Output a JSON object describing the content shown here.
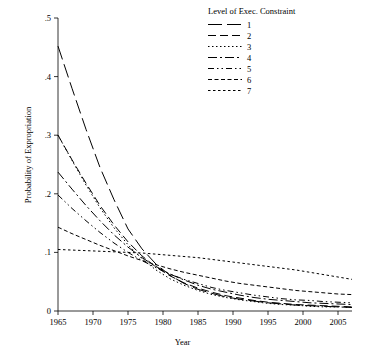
{
  "chart_data": {
    "type": "line",
    "title": "",
    "xlabel": "Year",
    "ylabel": "Probability of Expropriation",
    "xlim": [
      1965,
      2007
    ],
    "ylim": [
      0,
      0.5
    ],
    "xticks": [
      1965,
      1970,
      1975,
      1980,
      1985,
      1990,
      1995,
      2000,
      2005
    ],
    "xticklabels": [
      "1965",
      "1970",
      "1975",
      "1980",
      "1985",
      "1990",
      "1995",
      "2000",
      "2005"
    ],
    "yticks": [
      0,
      0.1,
      0.2,
      0.3,
      0.4,
      0.5
    ],
    "yticklabels": [
      "0",
      ".1",
      ".2",
      ".3",
      ".4",
      ".5"
    ],
    "grid": false,
    "legend": {
      "title": "Level of Exec. Constraint",
      "position": "top-right",
      "entries": [
        {
          "label": "1",
          "dash": "14 5"
        },
        {
          "label": "2",
          "dash": "8 4"
        },
        {
          "label": "3",
          "dash": "1.5 2.5"
        },
        {
          "label": "4",
          "dash": "9 3 2 3"
        },
        {
          "label": "5",
          "dash": "6 3 1.5 3 1.5 3"
        },
        {
          "label": "6",
          "dash": "4 2.5"
        },
        {
          "label": "7",
          "dash": "2.5 2.5"
        }
      ]
    },
    "x": [
      1965,
      1967,
      1969,
      1971,
      1973,
      1975,
      1977,
      1979,
      1981,
      1983,
      1985,
      1987,
      1989,
      1991,
      1993,
      1995,
      1997,
      1999,
      2001,
      2003,
      2005,
      2007
    ],
    "series": [
      {
        "name": "1",
        "values": [
          0.452,
          0.38,
          0.31,
          0.245,
          0.19,
          0.14,
          0.106,
          0.08,
          0.061,
          0.047,
          0.037,
          0.03,
          0.024,
          0.02,
          0.017,
          0.014,
          0.012,
          0.01,
          0.009,
          0.008,
          0.007,
          0.006
        ]
      },
      {
        "name": "2",
        "values": [
          0.3,
          0.258,
          0.218,
          0.18,
          0.147,
          0.118,
          0.094,
          0.075,
          0.06,
          0.048,
          0.039,
          0.032,
          0.026,
          0.022,
          0.018,
          0.015,
          0.013,
          0.011,
          0.01,
          0.009,
          0.008,
          0.007
        ]
      },
      {
        "name": "3",
        "values": [
          0.3,
          0.257,
          0.215,
          0.176,
          0.142,
          0.113,
          0.089,
          0.07,
          0.055,
          0.044,
          0.035,
          0.028,
          0.023,
          0.019,
          0.016,
          0.013,
          0.011,
          0.01,
          0.008,
          0.007,
          0.007,
          0.006
        ]
      },
      {
        "name": "4",
        "values": [
          0.237,
          0.208,
          0.18,
          0.154,
          0.13,
          0.109,
          0.091,
          0.076,
          0.063,
          0.053,
          0.044,
          0.037,
          0.032,
          0.027,
          0.023,
          0.02,
          0.018,
          0.016,
          0.014,
          0.013,
          0.012,
          0.011
        ]
      },
      {
        "name": "5",
        "values": [
          0.198,
          0.175,
          0.154,
          0.134,
          0.116,
          0.1,
          0.086,
          0.074,
          0.063,
          0.054,
          0.047,
          0.04,
          0.035,
          0.031,
          0.027,
          0.024,
          0.021,
          0.019,
          0.018,
          0.016,
          0.015,
          0.014
        ]
      },
      {
        "name": "6",
        "values": [
          0.143,
          0.132,
          0.122,
          0.112,
          0.103,
          0.094,
          0.086,
          0.079,
          0.072,
          0.066,
          0.061,
          0.056,
          0.051,
          0.047,
          0.044,
          0.041,
          0.038,
          0.035,
          0.033,
          0.031,
          0.029,
          0.028
        ]
      },
      {
        "name": "7",
        "values": [
          0.105,
          0.104,
          0.103,
          0.102,
          0.101,
          0.1,
          0.099,
          0.097,
          0.095,
          0.093,
          0.091,
          0.088,
          0.085,
          0.082,
          0.079,
          0.076,
          0.073,
          0.07,
          0.066,
          0.062,
          0.058,
          0.054
        ]
      }
    ]
  }
}
